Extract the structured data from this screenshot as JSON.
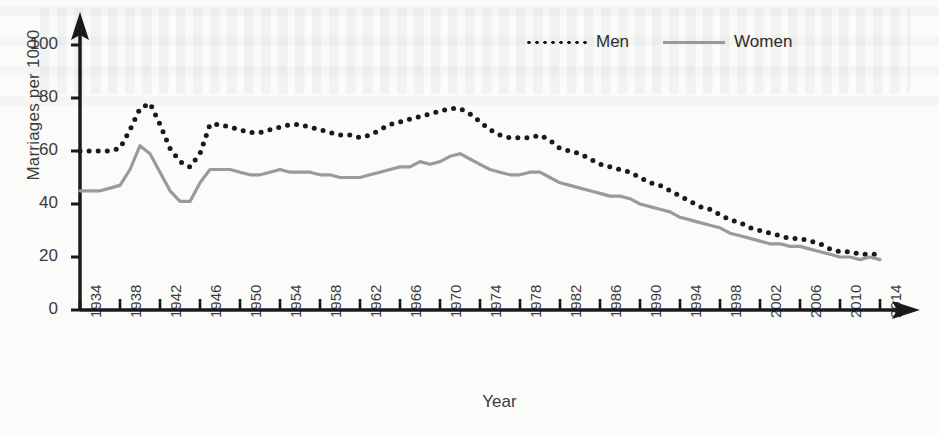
{
  "chart_data": {
    "type": "line",
    "title": "",
    "xlabel": "Year",
    "ylabel": "Marriages per 1000",
    "xlim": [
      1934,
      2014
    ],
    "ylim": [
      0,
      100
    ],
    "yticks": [
      0,
      20,
      40,
      60,
      80,
      100
    ],
    "xticks": [
      1934,
      1938,
      1942,
      1946,
      1950,
      1954,
      1958,
      1962,
      1966,
      1970,
      1974,
      1978,
      1982,
      1986,
      1990,
      1994,
      1998,
      2002,
      2006,
      2010,
      2014
    ],
    "grid": false,
    "legend_position": "top-right",
    "x": [
      1934,
      1935,
      1936,
      1937,
      1938,
      1939,
      1940,
      1941,
      1942,
      1943,
      1944,
      1945,
      1946,
      1947,
      1948,
      1949,
      1950,
      1951,
      1952,
      1953,
      1954,
      1955,
      1956,
      1957,
      1958,
      1959,
      1960,
      1961,
      1962,
      1963,
      1964,
      1965,
      1966,
      1967,
      1968,
      1969,
      1970,
      1971,
      1972,
      1973,
      1974,
      1975,
      1976,
      1977,
      1978,
      1979,
      1980,
      1981,
      1982,
      1983,
      1984,
      1985,
      1986,
      1987,
      1988,
      1989,
      1990,
      1991,
      1992,
      1993,
      1994,
      1995,
      1996,
      1997,
      1998,
      1999,
      2000,
      2001,
      2002,
      2003,
      2004,
      2005,
      2006,
      2007,
      2008,
      2009,
      2010,
      2011,
      2012,
      2013,
      2014
    ],
    "series": [
      {
        "name": "Men",
        "style": "dotted",
        "color": "#1a1a1a",
        "values": [
          60,
          60,
          60,
          60,
          61,
          68,
          76,
          78,
          70,
          61,
          56,
          54,
          59,
          70,
          70,
          69,
          68,
          67,
          67,
          68,
          69,
          70,
          70,
          69,
          68,
          67,
          66,
          66,
          65,
          66,
          68,
          70,
          71,
          72,
          73,
          74,
          75,
          76,
          76,
          74,
          71,
          68,
          66,
          65,
          65,
          65,
          66,
          64,
          61,
          60,
          59,
          57,
          55,
          54,
          53,
          52,
          50,
          48,
          47,
          45,
          43,
          41,
          39,
          38,
          36,
          34,
          33,
          31,
          30,
          29,
          28,
          27,
          27,
          26,
          25,
          23,
          22,
          22,
          21,
          21,
          21
        ]
      },
      {
        "name": "Women",
        "style": "solid",
        "color": "#9a9a9a",
        "values": [
          45,
          45,
          45,
          46,
          47,
          53,
          62,
          59,
          52,
          45,
          41,
          41,
          48,
          53,
          53,
          53,
          52,
          51,
          51,
          52,
          53,
          52,
          52,
          52,
          51,
          51,
          50,
          50,
          50,
          51,
          52,
          53,
          54,
          54,
          56,
          55,
          56,
          58,
          59,
          57,
          55,
          53,
          52,
          51,
          51,
          52,
          52,
          50,
          48,
          47,
          46,
          45,
          44,
          43,
          43,
          42,
          40,
          39,
          38,
          37,
          35,
          34,
          33,
          32,
          31,
          29,
          28,
          27,
          26,
          25,
          25,
          24,
          24,
          23,
          22,
          21,
          20,
          20,
          19,
          20,
          19
        ]
      }
    ]
  },
  "legend": {
    "men_label": "Men",
    "women_label": "Women"
  },
  "axes": {
    "ylabel": "Marriages per 1000",
    "xlabel": "Year"
  }
}
